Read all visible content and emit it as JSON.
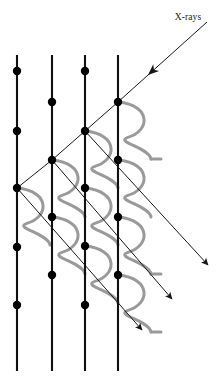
{
  "figure": {
    "title_label": "X-rays",
    "kind": "x-ray-diffraction-lattice-diagram",
    "background_color": "#ffffff",
    "lattice_color": "#101010",
    "atom_color": "#000000",
    "ray_color": "#1a1a1a",
    "wave_color": "#9a9a9a",
    "label_color": "#1a1a1a"
  },
  "label": {
    "text": "X-rays",
    "x": 188,
    "y": 20,
    "anchor": "middle"
  },
  "lattice": {
    "line_top_y": 55,
    "line_bottom_y": 371,
    "line_width": 2.1,
    "atom_radius": 4.2,
    "columns": [
      {
        "name": "lattice-plane-1",
        "x": 17,
        "atom_y": [
          71,
          131,
          188,
          247,
          305
        ]
      },
      {
        "name": "lattice-plane-2",
        "x": 52,
        "atom_y": [
          102,
          160,
          217,
          275
        ]
      },
      {
        "name": "lattice-plane-3",
        "x": 85,
        "atom_y": [
          71,
          131,
          188,
          246,
          305
        ]
      },
      {
        "name": "lattice-plane-4",
        "x": 118,
        "atom_y": [
          102,
          160,
          217,
          275
        ]
      }
    ]
  },
  "incident_ray": {
    "name": "incident-x-ray-beam",
    "start_x": 207,
    "start_y": 22,
    "end_x": 118,
    "end_y": 102,
    "arrowhead_x": 148,
    "arrowhead_y": 75,
    "stroke_width": 1.0
  },
  "transmitted_segments": [
    {
      "name": "ray-segment-a",
      "x1": 118,
      "y1": 102,
      "x2": 85,
      "y2": 131
    },
    {
      "name": "ray-segment-b",
      "x1": 85,
      "y1": 131,
      "x2": 52,
      "y2": 160
    },
    {
      "name": "ray-segment-c",
      "x1": 52,
      "y1": 160,
      "x2": 17,
      "y2": 188
    }
  ],
  "scattered_rays": [
    {
      "name": "scattered-ray-1",
      "x1": 85,
      "y1": 131,
      "x2": 208,
      "y2": 265,
      "arrowhead_x": 208,
      "arrowhead_y": 265
    },
    {
      "name": "scattered-ray-2",
      "x1": 52,
      "y1": 160,
      "x2": 172,
      "y2": 299,
      "arrowhead_x": 172,
      "arrowhead_y": 299
    },
    {
      "name": "scattered-ray-3",
      "x1": 17,
      "y1": 188,
      "x2": 142,
      "y2": 330,
      "arrowhead_x": 142,
      "arrowhead_y": 330
    }
  ],
  "wavefronts": {
    "stroke_width": 3.0,
    "dx": 33,
    "dy": 57,
    "tail_length": 10,
    "curves": [
      {
        "name": "wavefront-1",
        "x": 118,
        "y": 102,
        "tail": true
      },
      {
        "name": "wavefront-2",
        "x": 85,
        "y": 131,
        "tail": false
      },
      {
        "name": "wavefront-3",
        "x": 118,
        "y": 160,
        "tail": false
      },
      {
        "name": "wavefront-4",
        "x": 52,
        "y": 160,
        "tail": false
      },
      {
        "name": "wavefront-5",
        "x": 85,
        "y": 188,
        "tail": false
      },
      {
        "name": "wavefront-6",
        "x": 118,
        "y": 217,
        "tail": true
      },
      {
        "name": "wavefront-7",
        "x": 17,
        "y": 188,
        "tail": false
      },
      {
        "name": "wavefront-8",
        "x": 52,
        "y": 217,
        "tail": false
      },
      {
        "name": "wavefront-9",
        "x": 85,
        "y": 246,
        "tail": false
      },
      {
        "name": "wavefront-10",
        "x": 118,
        "y": 275,
        "tail": true
      }
    ]
  }
}
